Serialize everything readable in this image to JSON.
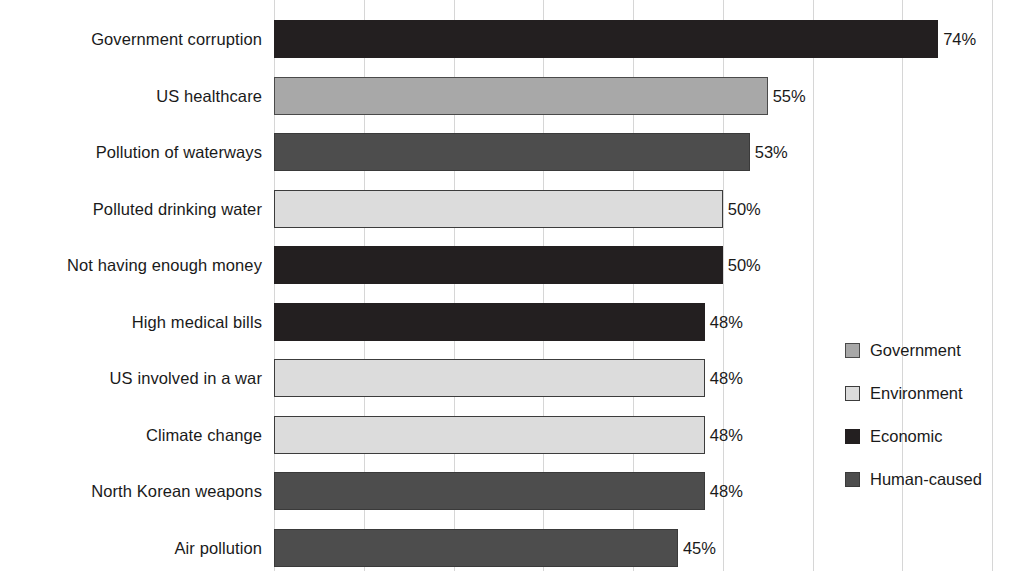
{
  "chart_data": {
    "type": "bar",
    "orientation": "horizontal",
    "title": "",
    "subtitle": "",
    "xlabel": "",
    "ylabel": "",
    "xlim": [
      0,
      82
    ],
    "grid": true,
    "grid_axis": "x",
    "value_suffix": "%",
    "legend_position": "right",
    "categories": [
      "Government corruption",
      "US healthcare",
      "Pollution of waterways",
      "Polluted drinking water",
      "Not having enough money",
      "High medical bills",
      "US involved in a war",
      "Climate change",
      "North Korean weapons",
      "Air pollution"
    ],
    "values": [
      74,
      55,
      53,
      50,
      50,
      48,
      48,
      48,
      48,
      45
    ],
    "value_labels": [
      "74%",
      "55%",
      "53%",
      "50%",
      "50%",
      "48%",
      "48%",
      "48%",
      "48%",
      "45%"
    ],
    "groups": [
      "economic",
      "government",
      "human",
      "environment",
      "economic",
      "economic",
      "environment",
      "environment",
      "human",
      "human"
    ],
    "series": [
      {
        "name": "Worries",
        "values": [
          74,
          55,
          53,
          50,
          50,
          48,
          48,
          48,
          48,
          45
        ]
      }
    ],
    "legend": [
      {
        "key": "government",
        "label": "Government",
        "color": "#a8a8a8"
      },
      {
        "key": "environment",
        "label": "Environment",
        "color": "#dcdcdc"
      },
      {
        "key": "economic",
        "label": "Economic",
        "color": "#231f20"
      },
      {
        "key": "human",
        "label": "Human-caused",
        "color": "#4d4d4d"
      }
    ],
    "gridline_values": [
      0,
      10,
      20,
      30,
      40,
      50,
      60,
      70,
      80
    ]
  }
}
